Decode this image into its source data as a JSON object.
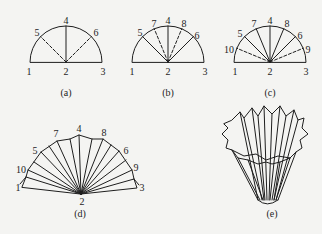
{
  "figure": {
    "panels": [
      {
        "id": "a",
        "caption": "(a)",
        "labels": {
          "p1": "1",
          "p2": "2",
          "p3": "3",
          "p4": "4",
          "p5": "5",
          "p6": "6"
        }
      },
      {
        "id": "b",
        "caption": "(b)",
        "labels": {
          "p1": "1",
          "p2": "2",
          "p3": "3",
          "p4": "4",
          "p5": "5",
          "p6": "6",
          "p7": "7",
          "p8": "8"
        }
      },
      {
        "id": "c",
        "caption": "(c)",
        "labels": {
          "p1": "1",
          "p2": "2",
          "p3": "3",
          "p4": "4",
          "p5": "5",
          "p6": "6",
          "p7": "7",
          "p8": "8",
          "p9": "9",
          "p10": "10"
        }
      },
      {
        "id": "d",
        "caption": "(d)",
        "labels": {
          "p1": "1",
          "p2": "2",
          "p3": "3",
          "p4": "4",
          "p5": "5",
          "p6": "6",
          "p7": "7",
          "p8": "8",
          "p9": "9",
          "p10": "10"
        }
      },
      {
        "id": "e",
        "caption": "(e)"
      }
    ],
    "colors": {
      "line": "#1e1e1e",
      "background": "#f4f4f2"
    }
  }
}
